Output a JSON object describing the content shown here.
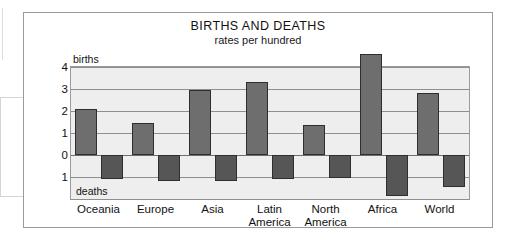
{
  "chart_data": {
    "type": "bar",
    "title": "BIRTHS AND DEATHS",
    "subtitle": "rates per hundred",
    "xlabel": "",
    "ylabel": "",
    "ylim": [
      -2.0,
      4.0
    ],
    "grid": true,
    "legend_position": "in-plot",
    "y_axis_caption_top": "births",
    "y_axis_caption_bottom": "deaths",
    "y_ticks": [
      "4",
      "3",
      "2",
      "1",
      "0",
      "1"
    ],
    "y_tick_values": [
      4,
      3,
      2,
      1,
      0,
      -1
    ],
    "categories": [
      "Oceania",
      "Europe",
      "Asia",
      "Latin America",
      "North America",
      "Africa",
      "World"
    ],
    "series": [
      {
        "name": "births",
        "values": [
          2.1,
          1.45,
          2.95,
          3.3,
          1.35,
          4.6,
          2.8
        ]
      },
      {
        "name": "deaths",
        "values": [
          -1.1,
          -1.2,
          -1.2,
          -1.1,
          -1.05,
          -1.85,
          -1.45
        ]
      }
    ],
    "colors": {
      "births_bar": "#6e6e6e",
      "deaths_bar": "#565656",
      "bar_outline": "#2e2e2e",
      "plot_background": "#eeeeee",
      "gridline": "#8f8f8f",
      "frame": "#9a9a9a",
      "text": "#111111",
      "page_background": "#ffffff"
    }
  },
  "category_label_lines": [
    [
      "Oceania",
      ""
    ],
    [
      "Europe",
      ""
    ],
    [
      "Asia",
      ""
    ],
    [
      "Latin",
      "America"
    ],
    [
      "North",
      "America"
    ],
    [
      "Africa",
      ""
    ],
    [
      "World",
      ""
    ]
  ]
}
